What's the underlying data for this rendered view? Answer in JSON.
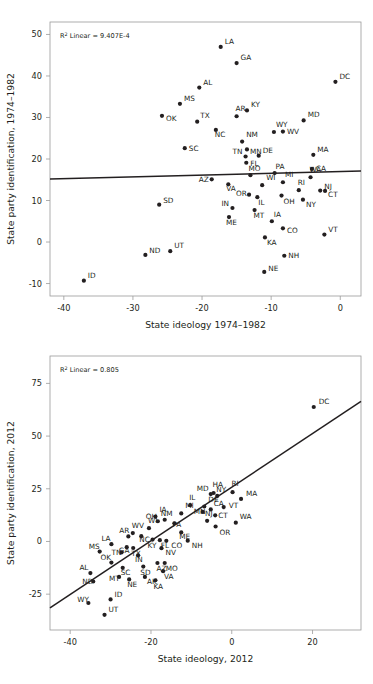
{
  "figure": {
    "background": "#ffffff",
    "ink": "#231f20",
    "axis_color": "#9a9a9a"
  },
  "chart_data": [
    {
      "id": "top",
      "type": "scatter",
      "title": "",
      "xlabel": "State ideology 1974–1982",
      "ylabel": "State party identification, 1974–1982",
      "annotation": "R² Linear = 9.407E-4",
      "r2": 0.0009407,
      "xlim": [
        -42,
        3
      ],
      "ylim": [
        -13,
        53
      ],
      "xticks": [
        -40,
        -30,
        -20,
        -10,
        0
      ],
      "yticks": [
        -10,
        0,
        10,
        20,
        30,
        40,
        50
      ],
      "grid": false,
      "legend": "none",
      "fit_line": {
        "x0": -42,
        "y0": 15.2,
        "x1": 3,
        "y1": 17.1
      },
      "points": [
        {
          "label": "LA",
          "x": -17.3,
          "y": 47.0,
          "lx": 4,
          "ly": -3
        },
        {
          "label": "GA",
          "x": -15.0,
          "y": 43.1,
          "lx": 4,
          "ly": -3
        },
        {
          "label": "DC",
          "x": -0.7,
          "y": 38.6,
          "lx": 4,
          "ly": -3
        },
        {
          "label": "AL",
          "x": -20.4,
          "y": 37.2,
          "lx": 4,
          "ly": -3
        },
        {
          "label": "MS",
          "x": -23.2,
          "y": 33.3,
          "lx": 4,
          "ly": -3
        },
        {
          "label": "KY",
          "x": -13.5,
          "y": 31.7,
          "lx": 4,
          "ly": -3
        },
        {
          "label": "AR",
          "x": -15.0,
          "y": 30.3,
          "lx": -1,
          "ly": -5
        },
        {
          "label": "OK",
          "x": -25.8,
          "y": 30.4,
          "lx": 4,
          "ly": 5
        },
        {
          "label": "MD",
          "x": -5.3,
          "y": 29.3,
          "lx": 4,
          "ly": -3
        },
        {
          "label": "TX",
          "x": -20.7,
          "y": 29.0,
          "lx": 3,
          "ly": -4
        },
        {
          "label": "NC",
          "x": -18.0,
          "y": 27.0,
          "lx": -1,
          "ly": 7
        },
        {
          "label": "WV",
          "x": -8.3,
          "y": 26.6,
          "lx": 4,
          "ly": 2
        },
        {
          "label": "WY",
          "x": -9.6,
          "y": 26.5,
          "lx": 2,
          "ly": -5
        },
        {
          "label": "NM",
          "x": -14.2,
          "y": 24.2,
          "lx": 0,
          "ly": -5
        },
        {
          "label": "SC",
          "x": -22.5,
          "y": 22.6,
          "lx": 4,
          "ly": 3
        },
        {
          "label": "MN",
          "x": -13.5,
          "y": 22.3,
          "lx": 3,
          "ly": 5
        },
        {
          "label": "MA",
          "x": -3.9,
          "y": 21.0,
          "lx": 4,
          "ly": -3
        },
        {
          "label": "DE",
          "x": -11.8,
          "y": 20.8,
          "lx": 4,
          "ly": 0
        },
        {
          "label": "TN",
          "x": -13.7,
          "y": 20.6,
          "lx": -13,
          "ly": 0
        },
        {
          "label": "FL",
          "x": -13.6,
          "y": 19.1,
          "lx": 4,
          "ly": 3
        },
        {
          "label": "CA",
          "x": -4.1,
          "y": 17.6,
          "lx": 4,
          "ly": 2
        },
        {
          "label": "PA",
          "x": -9.5,
          "y": 16.6,
          "lx": 1,
          "ly": -4
        },
        {
          "label": "MO",
          "x": -13.0,
          "y": 16.1,
          "lx": -2,
          "ly": -4
        },
        {
          "label": "WA",
          "x": -4.3,
          "y": 15.6,
          "lx": -1,
          "ly": -5
        },
        {
          "label": "AZ",
          "x": -18.6,
          "y": 15.1,
          "lx": -13,
          "ly": 3
        },
        {
          "label": "MI",
          "x": -8.3,
          "y": 14.4,
          "lx": 2,
          "ly": -5
        },
        {
          "label": "WI",
          "x": -11.3,
          "y": 13.7,
          "lx": 0,
          "ly": -5
        },
        {
          "label": "VA",
          "x": -16.2,
          "y": 13.9,
          "lx": -2,
          "ly": 7
        },
        {
          "label": "RI",
          "x": -6.0,
          "y": 12.5,
          "lx": -1,
          "ly": -5
        },
        {
          "label": "NJ",
          "x": -2.9,
          "y": 12.4,
          "lx": 4,
          "ly": -2
        },
        {
          "label": "CT",
          "x": -2.2,
          "y": 12.3,
          "lx": 3,
          "ly": 6
        },
        {
          "label": "OR",
          "x": -13.2,
          "y": 11.4,
          "lx": -13,
          "ly": 1
        },
        {
          "label": "IL",
          "x": -12.0,
          "y": 10.8,
          "lx": 1,
          "ly": 8
        },
        {
          "label": "OH",
          "x": -8.5,
          "y": 11.2,
          "lx": 2,
          "ly": 8
        },
        {
          "label": "NY",
          "x": -5.4,
          "y": 10.2,
          "lx": 3,
          "ly": 7
        },
        {
          "label": "SD",
          "x": -26.2,
          "y": 9.0,
          "lx": 4,
          "ly": -2
        },
        {
          "label": "IN",
          "x": -15.6,
          "y": 8.2,
          "lx": -11,
          "ly": -2
        },
        {
          "label": "MT",
          "x": -12.4,
          "y": 7.7,
          "lx": -1,
          "ly": 8
        },
        {
          "label": "ME",
          "x": -16.1,
          "y": 6.0,
          "lx": -3,
          "ly": 8
        },
        {
          "label": "IA",
          "x": -9.9,
          "y": 5.0,
          "lx": 2,
          "ly": -4
        },
        {
          "label": "CO",
          "x": -8.3,
          "y": 3.3,
          "lx": 4,
          "ly": 5
        },
        {
          "label": "VT",
          "x": -2.3,
          "y": 1.8,
          "lx": 4,
          "ly": -3
        },
        {
          "label": "KA",
          "x": -10.9,
          "y": 1.1,
          "lx": 2,
          "ly": 8
        },
        {
          "label": "UT",
          "x": -24.6,
          "y": -2.2,
          "lx": 4,
          "ly": -3
        },
        {
          "label": "ND",
          "x": -28.2,
          "y": -3.1,
          "lx": 4,
          "ly": -2
        },
        {
          "label": "NH",
          "x": -8.1,
          "y": -3.3,
          "lx": 4,
          "ly": 2
        },
        {
          "label": "NE",
          "x": -11.0,
          "y": -7.2,
          "lx": 4,
          "ly": -1
        },
        {
          "label": "ID",
          "x": -37.1,
          "y": -9.3,
          "lx": 4,
          "ly": -3
        }
      ]
    },
    {
      "id": "bottom",
      "type": "scatter",
      "title": "",
      "xlabel": "State ideology, 2012",
      "ylabel": "State party identification, 2012",
      "annotation": "R² Linear = 0.805",
      "r2": 0.805,
      "xlim": [
        -45,
        32
      ],
      "ylim": [
        -42,
        88
      ],
      "xticks": [
        -40,
        -20,
        0,
        20
      ],
      "yticks": [
        -25,
        0,
        25,
        50,
        75
      ],
      "grid": false,
      "legend": "none",
      "fit_line": {
        "x0": -45,
        "y0": -31.5,
        "x1": 32,
        "y1": 66.5
      },
      "points": [
        {
          "label": "DC",
          "x": 20.3,
          "y": 63.8,
          "lx": 5,
          "ly": -3
        },
        {
          "label": "RI",
          "x": 0.2,
          "y": 23.4,
          "lx": -1,
          "ly": -6
        },
        {
          "label": "HA",
          "x": -4.5,
          "y": 23.0,
          "lx": -1,
          "ly": -6
        },
        {
          "label": "MD",
          "x": -5.2,
          "y": 22.5,
          "lx": -14,
          "ly": -3
        },
        {
          "label": "NY",
          "x": -3.6,
          "y": 21.6,
          "lx": -1,
          "ly": -4
        },
        {
          "label": "MA",
          "x": 2.3,
          "y": 20.2,
          "lx": 5,
          "ly": 0
        },
        {
          "label": "IL",
          "x": -10.3,
          "y": 17.2,
          "lx": -1,
          "ly": -5
        },
        {
          "label": "DE",
          "x": -6.8,
          "y": 16.6,
          "lx": 0,
          "ly": -4
        },
        {
          "label": "VT",
          "x": -2.0,
          "y": 16.3,
          "lx": 5,
          "ly": 1
        },
        {
          "label": "CA",
          "x": -5.2,
          "y": 15.2,
          "lx": 3,
          "ly": -3
        },
        {
          "label": "MI",
          "x": -12.5,
          "y": 13.3,
          "lx": 0,
          "ly": -5
        },
        {
          "label": "MN",
          "x": -7.2,
          "y": 14.0,
          "lx": -9,
          "ly": 2
        },
        {
          "label": "CT",
          "x": -4.1,
          "y": 12.4,
          "lx": 3,
          "ly": 3
        },
        {
          "label": "IA",
          "x": -18.9,
          "y": 11.8,
          "lx": 0,
          "ly": -5
        },
        {
          "label": "NM",
          "x": -16.6,
          "y": 10.3,
          "lx": -4,
          "ly": -4
        },
        {
          "label": "OH",
          "x": -18.3,
          "y": 9.6,
          "lx": -12,
          "ly": -2
        },
        {
          "label": "PA",
          "x": -14.2,
          "y": 8.6,
          "lx": -2,
          "ly": 4
        },
        {
          "label": "NJ",
          "x": -6.1,
          "y": 9.8,
          "lx": -2,
          "ly": -5
        },
        {
          "label": "WA",
          "x": 1.0,
          "y": 8.9,
          "lx": 0,
          "ly": -4
        },
        {
          "label": "WI",
          "x": -20.5,
          "y": 6.3,
          "lx": -1,
          "ly": -5
        },
        {
          "label": "OR",
          "x": -4.0,
          "y": 7.1,
          "lx": 0,
          "ly": 8
        },
        {
          "label": "WV",
          "x": -24.5,
          "y": 4.0,
          "lx": -1,
          "ly": -5
        },
        {
          "label": "ME",
          "x": -12.5,
          "y": 4.3,
          "lx": -2,
          "ly": 7
        },
        {
          "label": "AR",
          "x": -25.6,
          "y": 2.4,
          "lx": -9,
          "ly": -3
        },
        {
          "label": "NC",
          "x": -22.4,
          "y": 2.5,
          "lx": -2,
          "ly": 6
        },
        {
          "label": "KY",
          "x": -19.6,
          "y": 0.9,
          "lx": -5,
          "ly": 8
        },
        {
          "label": "FL",
          "x": -17.8,
          "y": 0.6,
          "lx": 1,
          "ly": 8
        },
        {
          "label": "CO",
          "x": -16.2,
          "y": 0.3,
          "lx": 5,
          "ly": 7
        },
        {
          "label": "NH",
          "x": -10.9,
          "y": 0.4,
          "lx": 4,
          "ly": 7
        },
        {
          "label": "LA",
          "x": -29.8,
          "y": -1.3,
          "lx": -10,
          "ly": -3
        },
        {
          "label": "GA",
          "x": -26.0,
          "y": -2.7,
          "lx": -8,
          "ly": 6
        },
        {
          "label": "TX",
          "x": -24.4,
          "y": -3.1,
          "lx": -2,
          "ly": 8
        },
        {
          "label": "NV",
          "x": -17.4,
          "y": -3.2,
          "lx": 4,
          "ly": 7
        },
        {
          "label": "MS",
          "x": -32.7,
          "y": -4.8,
          "lx": -11,
          "ly": 0
        },
        {
          "label": "TN",
          "x": -27.3,
          "y": -5.2,
          "lx": -10,
          "ly": 3
        },
        {
          "label": "IN",
          "x": -23.2,
          "y": -6.6,
          "lx": -3,
          "ly": 7
        },
        {
          "label": "OK",
          "x": -29.8,
          "y": -10.0,
          "lx": -11,
          "ly": 0
        },
        {
          "label": "SC",
          "x": -27.0,
          "y": -12.5,
          "lx": -2,
          "ly": 7
        },
        {
          "label": "SD",
          "x": -21.9,
          "y": -11.9,
          "lx": -3,
          "ly": 8
        },
        {
          "label": "AZ",
          "x": -18.4,
          "y": -10.2,
          "lx": -1,
          "ly": 8
        },
        {
          "label": "MO",
          "x": -16.6,
          "y": -10.2,
          "lx": 1,
          "ly": 8
        },
        {
          "label": "VA",
          "x": -17.0,
          "y": -14.1,
          "lx": 1,
          "ly": 8
        },
        {
          "label": "AL",
          "x": -35.0,
          "y": -15.0,
          "lx": -11,
          "ly": 0
        },
        {
          "label": "MT",
          "x": -27.9,
          "y": -16.8,
          "lx": -10,
          "ly": 4
        },
        {
          "label": "AK",
          "x": -21.5,
          "y": -16.8,
          "lx": 2,
          "ly": 7
        },
        {
          "label": "ND",
          "x": -34.3,
          "y": -19.0,
          "lx": -11,
          "ly": 2
        },
        {
          "label": "NE",
          "x": -25.4,
          "y": -18.0,
          "lx": -2,
          "ly": 8
        },
        {
          "label": "KA",
          "x": -18.9,
          "y": -18.4,
          "lx": -2,
          "ly": 9
        },
        {
          "label": "ID",
          "x": -30.0,
          "y": -27.5,
          "lx": 4,
          "ly": -2
        },
        {
          "label": "WY",
          "x": -35.5,
          "y": -29.2,
          "lx": -11,
          "ly": -1
        },
        {
          "label": "UT",
          "x": -31.5,
          "y": -34.8,
          "lx": 4,
          "ly": 0
        }
      ]
    }
  ]
}
